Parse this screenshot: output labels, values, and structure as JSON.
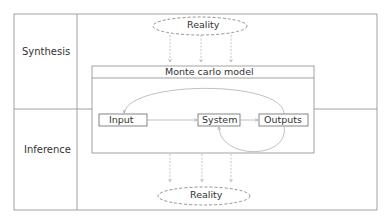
{
  "rows": [
    {
      "label": "Synthesis"
    },
    {
      "label": "Inference"
    }
  ],
  "model": {
    "title": "Monte carlo model",
    "nodes": [
      {
        "id": "input",
        "label": "Input"
      },
      {
        "id": "system",
        "label": "System"
      },
      {
        "id": "outputs",
        "label": "Outputs"
      }
    ]
  },
  "reality_top": {
    "label": "Reality"
  },
  "reality_bottom": {
    "label": "Reality"
  },
  "colors": {
    "border": "#8a8a8a",
    "arrow": "#b0b0b0",
    "text": "#333333"
  }
}
